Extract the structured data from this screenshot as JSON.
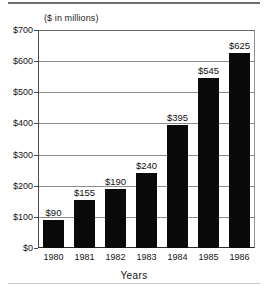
{
  "chart_data": {
    "type": "bar",
    "title": "",
    "subtitle": "($ in millions)",
    "xlabel": "Years",
    "ylabel": "",
    "categories": [
      "1980",
      "1981",
      "1982",
      "1983",
      "1984",
      "1985",
      "1986"
    ],
    "values": [
      90,
      155,
      190,
      240,
      395,
      545,
      625
    ],
    "data_labels": [
      "$90",
      "$155",
      "$190",
      "$240",
      "$395",
      "$545",
      "$625"
    ],
    "ylim": [
      0,
      700
    ],
    "ytick_values": [
      0,
      100,
      200,
      300,
      400,
      500,
      600,
      700
    ],
    "ytick_labels": [
      "$0",
      "$100",
      "$200",
      "$300",
      "$400",
      "$500",
      "$600",
      "$700"
    ],
    "grid": "horizontal",
    "legend": "none",
    "bar_color": "#0a0a0a",
    "background_color": "#ffffff",
    "axis_color": "#333333",
    "gridline_color": "#8d8d8d"
  }
}
